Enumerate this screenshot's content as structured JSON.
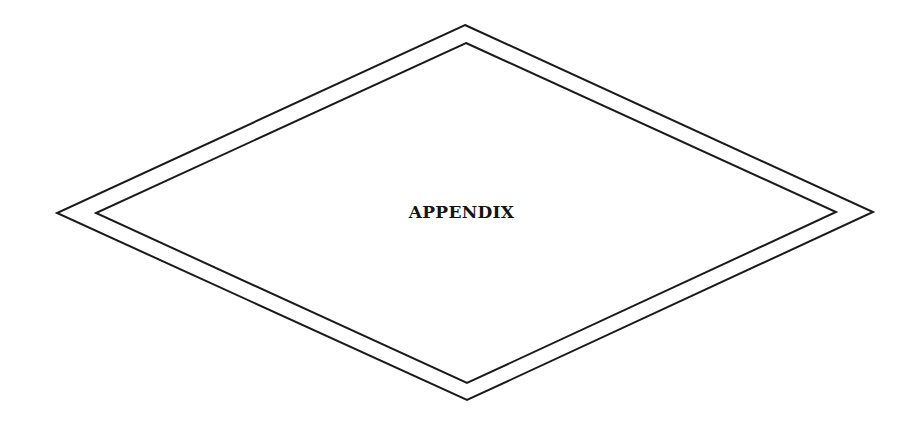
{
  "page": {
    "heading": "APPENDIX",
    "colors": {
      "background": "#ffffff",
      "line": "#1a1a1a",
      "text": "#141414"
    },
    "shapes": {
      "outer_diamond": "465,25 873,212 467,400 57,213",
      "inner_diamond": "466,43 836,212 467,383 96,213"
    }
  }
}
